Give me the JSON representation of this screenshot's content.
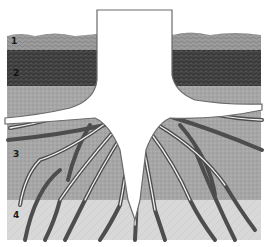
{
  "diagram": {
    "layers": [
      {
        "id": 1,
        "label": "1",
        "description": "topsoil / surface litter layer",
        "color": "#9a9a9a",
        "y_top": 34,
        "y_bottom": 50
      },
      {
        "id": 2,
        "label": "2",
        "description": "dark humus-rich layer",
        "color": "#4a4a4a",
        "y_top": 50,
        "y_bottom": 86
      },
      {
        "id": 3,
        "label": "3",
        "description": "subsoil layer with spreading roots",
        "color": "#a8a8a8",
        "y_top": 86,
        "y_bottom": 200
      },
      {
        "id": 4,
        "label": "4",
        "description": "parent material / bedrock layer",
        "color": "#d6d6d6",
        "y_top": 200,
        "y_bottom": 240
      }
    ],
    "label_positions": [
      {
        "text": "1",
        "x": 11,
        "y": 37
      },
      {
        "text": "2",
        "x": 13,
        "y": 69
      },
      {
        "text": "3",
        "x": 13,
        "y": 150
      },
      {
        "text": "4",
        "x": 13,
        "y": 211
      }
    ],
    "colors": {
      "background": "#ffffff",
      "trunk": "#ffffff",
      "root_outline": "#555555"
    }
  }
}
